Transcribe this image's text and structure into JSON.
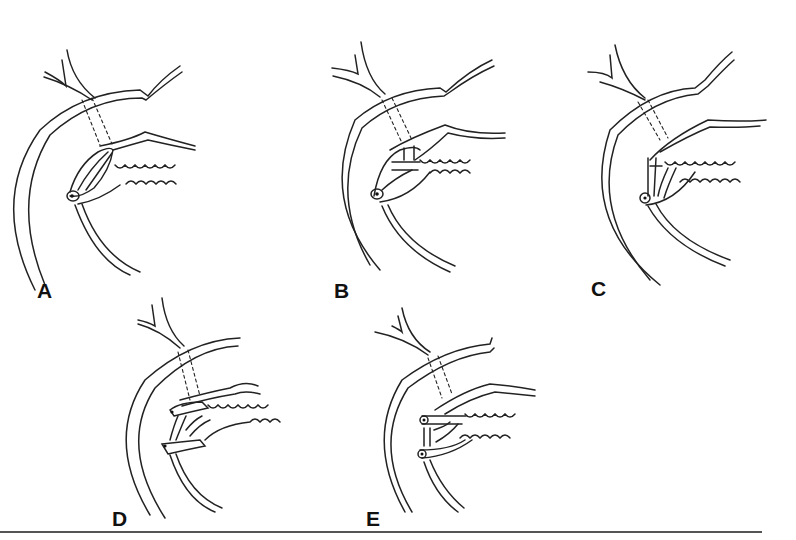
{
  "figure": {
    "panels": [
      {
        "id": "A",
        "label": "A",
        "variant": "single-papilla-loop"
      },
      {
        "id": "B",
        "label": "B",
        "variant": "single-papilla-bridge"
      },
      {
        "id": "C",
        "label": "C",
        "variant": "single-papilla-branched"
      },
      {
        "id": "D",
        "label": "D",
        "variant": "two-papillae"
      },
      {
        "id": "E",
        "label": "E",
        "variant": "two-papillae-separate"
      }
    ],
    "colors": {
      "line": "#222222",
      "background": "#ffffff",
      "rule": "#555555"
    }
  }
}
